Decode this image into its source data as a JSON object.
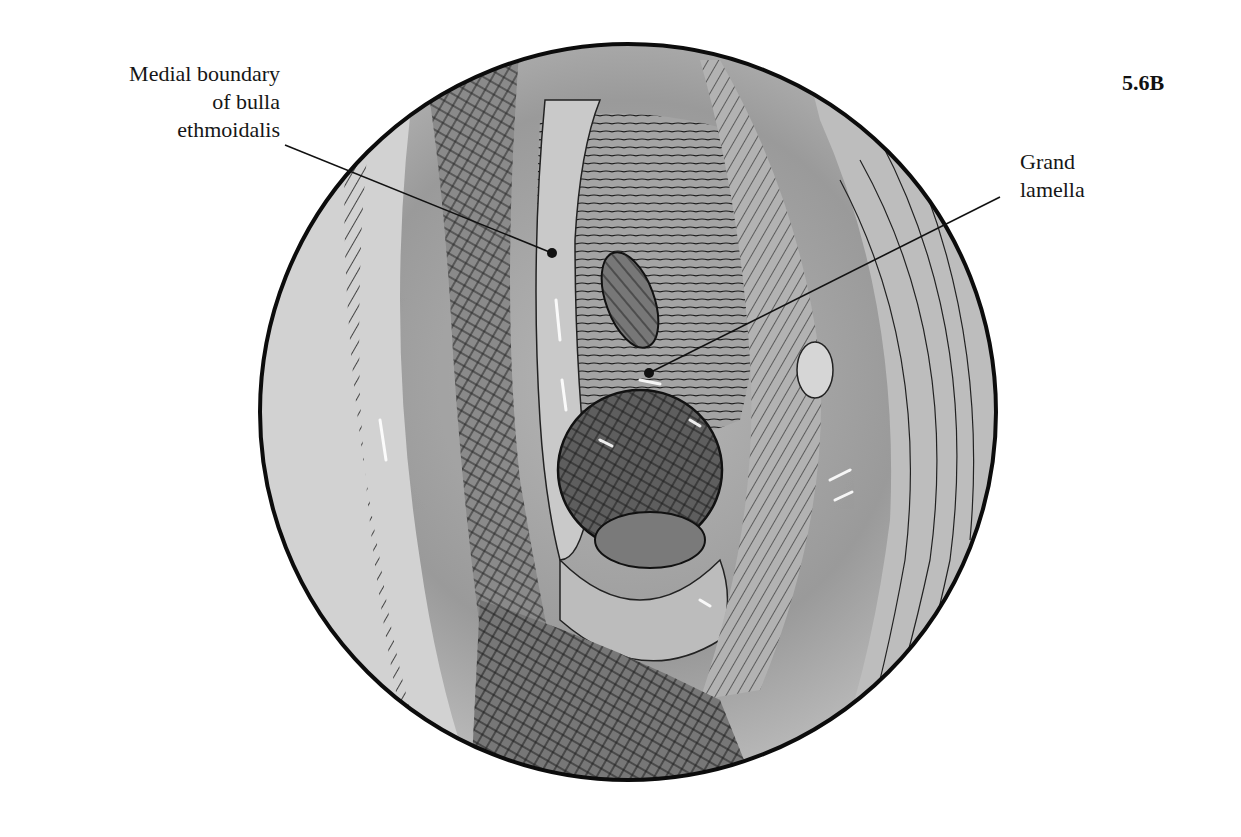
{
  "figure": {
    "number": "5.6B"
  },
  "labels": [
    {
      "lines": [
        "Medial boundary",
        "of bulla",
        "ethmoidalis"
      ],
      "target": "left-upper structure"
    },
    {
      "lines": [
        "Grand",
        "lamella"
      ],
      "target": "central structure"
    }
  ],
  "colors": {
    "ink": "#111111",
    "tone_light": "#d6d6d6",
    "tone_mid": "#a8a8a8",
    "tone_dark": "#555555"
  }
}
